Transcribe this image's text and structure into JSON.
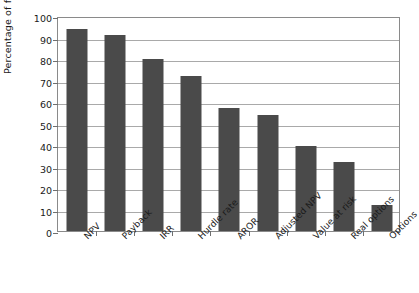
{
  "chart_data": {
    "type": "bar",
    "title": "",
    "subtitle": "",
    "xlabel": "",
    "ylabel": "Percentage of firms",
    "categories": [
      "NPV",
      "Payback",
      "IRR",
      "Hurdle rate",
      "AROR",
      "Adjusted NPV",
      "Value at risk",
      "Real options",
      "Options"
    ],
    "values": [
      94,
      91,
      80,
      72,
      57,
      54,
      39.5,
      32,
      12
    ],
    "ylim": [
      0,
      100
    ],
    "ytick_labels": [
      "0",
      "10",
      "20",
      "30",
      "40",
      "50",
      "60",
      "70",
      "80",
      "90",
      "100"
    ],
    "ytick_values": [
      0,
      10,
      20,
      30,
      40,
      50,
      60,
      70,
      80,
      90,
      100
    ],
    "grid": true,
    "legend": null,
    "legend_position": "none",
    "bar_color": "#4a4a4a",
    "gridline_color": "#a9a9a9",
    "frame_color": "#8a8a8a",
    "background_color": "#ffffff"
  }
}
